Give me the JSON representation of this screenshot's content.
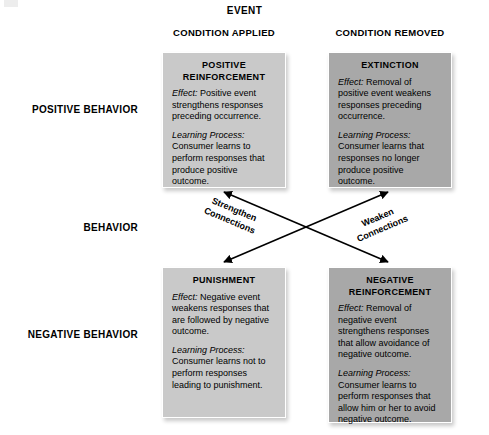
{
  "diagram": {
    "top_axis_title": "EVENT",
    "left_axis_title": "BEHAVIOR",
    "column_headers": [
      "CONDITION APPLIED",
      "CONDITION REMOVED"
    ],
    "row_headers": [
      "POSITIVE\nBEHAVIOR",
      "NEGATIVE\nBEHAVIOR"
    ],
    "colors": {
      "box_light": "#c9c9c9",
      "box_dark": "#a8a8a8",
      "box_border": "#ffffff",
      "text": "#000000",
      "arrow": "#000000",
      "background": "#ffffff"
    },
    "quadrants": [
      {
        "id": "positive-reinforcement",
        "title": "POSITIVE\nREINFORCEMENT",
        "effect_label": "Effect:",
        "effect_text": "Positive event strengthens responses preceding occurrence.",
        "process_label": "Learning Process:",
        "process_text": "Consumer learns to perform responses that produce positive outcome.",
        "shade": "light"
      },
      {
        "id": "extinction",
        "title": "EXTINCTION",
        "effect_label": "Effect:",
        "effect_text": "Removal of positive event weakens responses preceding occurrence.",
        "process_label": "Learning Process:",
        "process_text": "Consumer learns that responses no longer produce positive outcome.",
        "shade": "dark"
      },
      {
        "id": "punishment",
        "title": "PUNISHMENT",
        "effect_label": "Effect:",
        "effect_text": "Negative event weakens responses that are followed by negative outcome.",
        "process_label": "Learning Process:",
        "process_text": "Consumer learns not to perform responses leading to punishment.",
        "shade": "light"
      },
      {
        "id": "negative-reinforcement",
        "title": "NEGATIVE\nREINFORCEMENT",
        "effect_label": "Effect:",
        "effect_text": "Removal of negative event strengthens responses that allow avoidance of negative outcome.",
        "process_label": "Learning Process:",
        "process_text": "Consumer learns to perform responses that allow him or her to avoid negative outcome.",
        "shade": "dark"
      }
    ],
    "connectors": [
      {
        "id": "strengthen-connections",
        "label": "Strengthen\nConnections",
        "style": "double-headed-arrow",
        "from": "positive-reinforcement",
        "to": "negative-reinforcement"
      },
      {
        "id": "weaken-connections",
        "label": "Weaken\nConnections",
        "style": "double-headed-arrow",
        "from": "extinction",
        "to": "punishment"
      }
    ]
  }
}
